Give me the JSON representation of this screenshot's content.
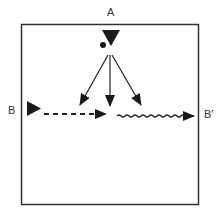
{
  "diagram": {
    "labels": {
      "top": "A",
      "left": "B",
      "right": "B′"
    },
    "elements": {
      "source_triangle_top": "filled triangle pointing down at A",
      "source_triangle_left": "filled triangle pointing right at B",
      "dashed_path": "dashed arrow from B to center",
      "wavy_path": "wavy arrow from center to B′",
      "fan_arrows": 3
    },
    "colors": {
      "stroke": "#222222",
      "fill": "#1a1a1a"
    }
  }
}
